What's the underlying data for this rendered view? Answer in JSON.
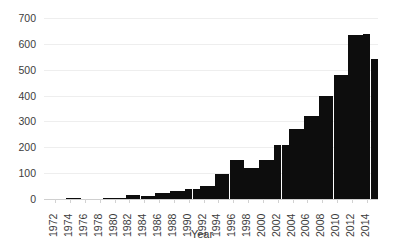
{
  "chart_data": {
    "type": "bar",
    "title": "",
    "subtitle": "",
    "xlabel": "Year",
    "ylabel": "",
    "grid": true,
    "legend": null,
    "legend_position": "none",
    "xlim": [
      1971,
      2016
    ],
    "ylim": [
      0,
      700
    ],
    "ytick_values": [
      0,
      100,
      200,
      300,
      400,
      500,
      600,
      700
    ],
    "ytick_labels": [
      "0",
      "100",
      "200",
      "300",
      "400",
      "500",
      "600",
      "700"
    ],
    "xtick_values": [
      1972,
      1974,
      1976,
      1978,
      1980,
      1982,
      1984,
      1986,
      1988,
      1990,
      1992,
      1994,
      1996,
      1998,
      2000,
      2002,
      2004,
      2006,
      2008,
      2010,
      2012,
      2014
    ],
    "xtick_labels": [
      "1972",
      "1974",
      "1976",
      "1978",
      "1980",
      "1982",
      "1984",
      "1986",
      "1988",
      "1990",
      "1992",
      "1994",
      "1996",
      "1998",
      "2000",
      "2002",
      "2004",
      "2006",
      "2008",
      "2010",
      "2012",
      "2014"
    ],
    "bar_color": "#0d0d0d",
    "categories": [
      1972,
      1973,
      1974,
      1975,
      1976,
      1977,
      1978,
      1979,
      1980,
      1981,
      1982,
      1983,
      1984,
      1985,
      1986,
      1987,
      1988,
      1989,
      1990,
      1991,
      1992,
      1993,
      1994,
      1995,
      1996,
      1997,
      1998,
      1999,
      2000,
      2001,
      2002,
      2003,
      2004,
      2005,
      2006,
      2007,
      2008,
      2009,
      2010,
      2011,
      2012,
      2013,
      2014,
      2015
    ],
    "values": [
      0,
      0,
      3,
      3,
      0,
      0,
      0,
      4,
      5,
      5,
      14,
      14,
      10,
      10,
      24,
      24,
      30,
      30,
      40,
      40,
      52,
      52,
      95,
      95,
      150,
      150,
      120,
      120,
      150,
      150,
      210,
      210,
      270,
      270,
      320,
      320,
      400,
      400,
      480,
      480,
      635,
      635,
      640,
      540
    ]
  },
  "axis": {
    "x_title": "Year"
  }
}
